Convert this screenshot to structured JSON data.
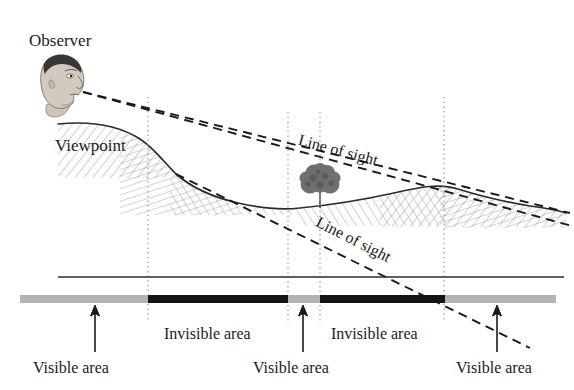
{
  "figure": {
    "type": "viewshed-line-of-sight-diagram",
    "width": 574,
    "height": 390,
    "background": "#ffffff"
  },
  "labels": {
    "observer": "Observer",
    "viewpoint": "Viewpoint",
    "line_of_sight_upper": "Line of sight",
    "line_of_sight_lower": "Line of sight",
    "invisible_area_1": "Invisible area",
    "invisible_area_2": "Invisible area",
    "visible_area_1": "Visible area",
    "visible_area_2": "Visible area",
    "visible_area_3": "Visible area"
  },
  "colors": {
    "ink": "#1a1a1a",
    "terrain_line": "#2b2b2b",
    "hatch": "#8c8c8c",
    "visible_band": "#b3b3b3",
    "invisible_band": "#141414",
    "dotted_guide": "#9a9a9a",
    "tree": "#6e6e6e",
    "head_skin": "#cfc6bd",
    "head_hair": "#3c3632"
  },
  "visibility_strip": {
    "y": 295,
    "height": 8,
    "segments": [
      {
        "kind": "visible",
        "label": "Visible area",
        "x_start": 20,
        "x_end": 148,
        "color": "#b3b3b3"
      },
      {
        "kind": "invisible",
        "label": "Invisible area",
        "x_start": 148,
        "x_end": 288,
        "color": "#141414"
      },
      {
        "kind": "visible",
        "label": "Visible area",
        "x_start": 288,
        "x_end": 320,
        "color": "#b3b3b3"
      },
      {
        "kind": "invisible",
        "label": "Invisible area",
        "x_start": 320,
        "x_end": 445,
        "color": "#141414"
      },
      {
        "kind": "visible",
        "label": "Visible area",
        "x_start": 445,
        "x_end": 556,
        "color": "#b3b3b3"
      }
    ]
  },
  "dotted_guides_x": [
    148,
    288,
    320,
    444
  ],
  "leader_arrows": [
    {
      "name": "visible-area-1-arrow",
      "x": 95,
      "y_from": 352,
      "y_to": 306
    },
    {
      "name": "visible-area-2-arrow",
      "x": 303,
      "y_from": 352,
      "y_to": 306
    },
    {
      "name": "visible-area-3-arrow",
      "x": 497,
      "y_from": 352,
      "y_to": 306
    }
  ],
  "datum_line": {
    "y": 277,
    "x_start": 58,
    "x_end": 564
  },
  "observer": {
    "eye_x": 83,
    "eye_y": 92
  },
  "tree": {
    "x": 320,
    "canopy_y": 182,
    "base_y": 208
  }
}
